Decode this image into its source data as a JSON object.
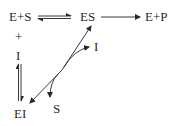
{
  "diagram": {
    "type": "reaction-scheme",
    "nodes": {
      "reactants": "E+S",
      "complex": "ES",
      "products": "E+P",
      "plus": "+",
      "inhibitor_left": "I",
      "inhibitor_right": "I",
      "inhibited_complex": "EI",
      "substrate_released": "S"
    },
    "edges": [
      {
        "from": "E+S",
        "to": "ES",
        "style": "reversible-equilibrium"
      },
      {
        "from": "ES",
        "to": "E+P",
        "style": "arrow"
      },
      {
        "from": "I",
        "to": "EI",
        "style": "reversible-vertical"
      },
      {
        "from": "EI",
        "to": "ES",
        "style": "arrow"
      },
      {
        "from": "EI-ES-branch",
        "to": "I",
        "style": "curved-arrow"
      },
      {
        "from": "ES",
        "to": "EI",
        "style": "arrow"
      },
      {
        "from": "ES-EI-branch",
        "to": "S",
        "style": "curved-arrow"
      }
    ],
    "colors": {
      "ink": "#2a2a2a",
      "background": "#ffffff"
    }
  }
}
